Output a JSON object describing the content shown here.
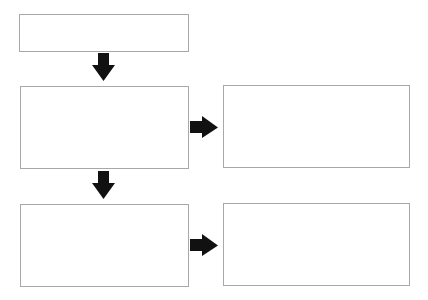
{
  "diagram": {
    "type": "flowchart",
    "background": "#ffffff",
    "box_border_color": "#a8a8a8",
    "arrow_color": "#111111",
    "boxes": [
      {
        "id": "box-1",
        "label": "",
        "x": 19,
        "y": 14,
        "w": 170,
        "h": 38
      },
      {
        "id": "box-2",
        "label": "",
        "x": 20,
        "y": 86,
        "w": 169,
        "h": 83
      },
      {
        "id": "box-3",
        "label": "",
        "x": 223,
        "y": 85,
        "w": 187,
        "h": 83
      },
      {
        "id": "box-4",
        "label": "",
        "x": 20,
        "y": 204,
        "w": 169,
        "h": 83
      },
      {
        "id": "box-5",
        "label": "",
        "x": 223,
        "y": 203,
        "w": 187,
        "h": 83
      }
    ],
    "arrows": [
      {
        "from": "box-1",
        "to": "box-2",
        "direction": "down"
      },
      {
        "from": "box-2",
        "to": "box-3",
        "direction": "right"
      },
      {
        "from": "box-2",
        "to": "box-4",
        "direction": "down"
      },
      {
        "from": "box-4",
        "to": "box-5",
        "direction": "right"
      }
    ]
  }
}
